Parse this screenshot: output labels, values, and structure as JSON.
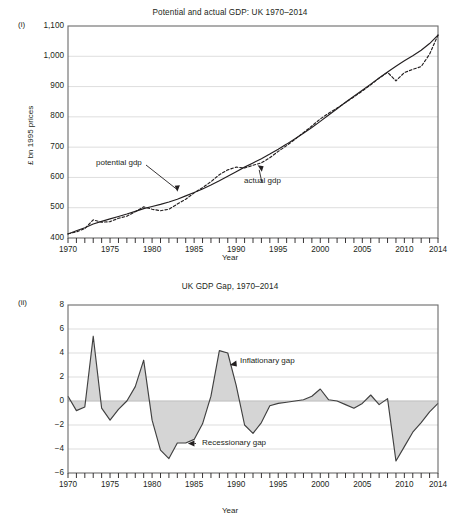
{
  "figure": {
    "panels": [
      {
        "label": "(i)",
        "title": "Potential and actual GDP: UK 1970–2014",
        "xlabel": "Year",
        "ylabel": "£ bn 1995 prices"
      },
      {
        "label": "(ii)",
        "title": "UK GDP Gap, 1970–2014",
        "xlabel": "Year",
        "ylabel": "Percent of Y*"
      }
    ]
  },
  "chart_data": [
    {
      "type": "line",
      "title": "Potential and actual GDP: UK 1970–2014",
      "xlabel": "Year",
      "ylabel": "£ bn 1995 prices",
      "xlim": [
        1970,
        2014
      ],
      "ylim": [
        400,
        1100
      ],
      "yticks": [
        400,
        500,
        600,
        700,
        800,
        900,
        1000,
        1100
      ],
      "ytick_labels": [
        "400",
        "500",
        "600",
        "700",
        "800",
        "900",
        "1,000",
        "1,100"
      ],
      "xticks": [
        1970,
        1975,
        1980,
        1985,
        1990,
        1995,
        2000,
        2005,
        2010,
        2014
      ],
      "xtick_labels": [
        "1970",
        "1975",
        "1980",
        "1985",
        "1990",
        "1995",
        "2000",
        "2005",
        "2010",
        "2014"
      ],
      "minor_xticks_every": 1,
      "grid": "horizontal",
      "legend": "annotations",
      "annotations": [
        {
          "text": "potential gdp",
          "target_x": 1983,
          "target_y": 553
        },
        {
          "text": "actual gdp",
          "target_x": 1992.5,
          "target_y": 655
        }
      ],
      "x": [
        1970,
        1971,
        1972,
        1973,
        1974,
        1975,
        1976,
        1977,
        1978,
        1979,
        1980,
        1981,
        1982,
        1983,
        1984,
        1985,
        1986,
        1987,
        1988,
        1989,
        1990,
        1991,
        1992,
        1993,
        1994,
        1995,
        1996,
        1997,
        1998,
        1999,
        2000,
        2001,
        2002,
        2003,
        2004,
        2005,
        2006,
        2007,
        2008,
        2009,
        2010,
        2011,
        2012,
        2013,
        2014
      ],
      "series": [
        {
          "name": "potential gdp",
          "style": "solid",
          "values": [
            413,
            424,
            434,
            446,
            455,
            463,
            471,
            479,
            488,
            497,
            504,
            511,
            519,
            528,
            539,
            550,
            562,
            575,
            589,
            604,
            619,
            634,
            648,
            662,
            677,
            693,
            710,
            728,
            746,
            765,
            785,
            806,
            827,
            848,
            868,
            888,
            908,
            928,
            948,
            967,
            985,
            1002,
            1020,
            1042,
            1070
          ]
        },
        {
          "name": "actual gdp",
          "style": "dashed",
          "values": [
            414,
            420,
            431,
            460,
            452,
            454,
            465,
            472,
            487,
            503,
            495,
            490,
            495,
            512,
            528,
            549,
            566,
            586,
            609,
            625,
            634,
            631,
            640,
            648,
            665,
            686,
            705,
            726,
            748,
            770,
            793,
            812,
            829,
            847,
            866,
            885,
            906,
            928,
            947,
            919,
            946,
            957,
            966,
            1007,
            1070
          ]
        }
      ]
    },
    {
      "type": "area",
      "title": "UK GDP Gap, 1970–2014",
      "xlabel": "Year",
      "ylabel": "Percent of Y*",
      "xlim": [
        1970,
        2014
      ],
      "ylim": [
        -6,
        8
      ],
      "yticks": [
        -6,
        -4,
        -2,
        0,
        2,
        4,
        6,
        8
      ],
      "ytick_labels": [
        "−6",
        "−4",
        "−2",
        "0",
        "2",
        "4",
        "6",
        "8"
      ],
      "xticks": [
        1970,
        1975,
        1980,
        1985,
        1990,
        1995,
        2000,
        2005,
        2010,
        2014
      ],
      "xtick_labels": [
        "1970",
        "1975",
        "1980",
        "1985",
        "1990",
        "1995",
        "2000",
        "2005",
        "2010",
        "2014"
      ],
      "minor_xticks_every": 1,
      "grid": "horizontal",
      "baseline": 0,
      "fill_color": "#d5d5d5",
      "line_color": "#404040",
      "annotations": [
        {
          "text": "Inflationary gap",
          "target_x": 1989.3,
          "target_y": 3.0
        },
        {
          "text": "Recessionary gap",
          "target_x": 1984.2,
          "target_y": -3.5
        }
      ],
      "x": [
        1970,
        1971,
        1972,
        1973,
        1974,
        1975,
        1976,
        1977,
        1978,
        1979,
        1980,
        1981,
        1982,
        1983,
        1984,
        1985,
        1986,
        1987,
        1988,
        1989,
        1990,
        1991,
        1992,
        1993,
        1994,
        1995,
        1996,
        1997,
        1998,
        1999,
        2000,
        2001,
        2002,
        2003,
        2004,
        2005,
        2006,
        2007,
        2008,
        2009,
        2010,
        2011,
        2012,
        2013,
        2014
      ],
      "values": [
        0.4,
        -0.8,
        -0.5,
        5.4,
        -0.6,
        -1.6,
        -0.7,
        0.0,
        1.2,
        3.4,
        -1.6,
        -4.1,
        -4.8,
        -3.5,
        -3.5,
        -3.2,
        -1.9,
        0.4,
        4.2,
        4.0,
        1.3,
        -2.0,
        -2.7,
        -1.8,
        -0.4,
        -0.2,
        -0.1,
        0.0,
        0.1,
        0.4,
        1.0,
        0.1,
        0.0,
        -0.3,
        -0.6,
        -0.2,
        0.5,
        -0.3,
        0.2,
        -5.0,
        -3.8,
        -2.6,
        -1.8,
        -0.9,
        -0.2
      ]
    }
  ]
}
